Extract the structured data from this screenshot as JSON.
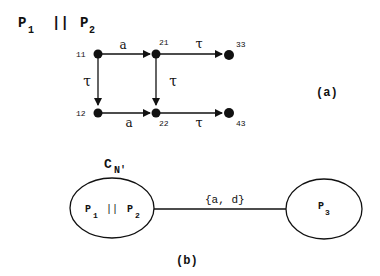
{
  "figure_a": {
    "title": {
      "p1": "P",
      "p1_sub": "1",
      "op": "||",
      "p2": "P",
      "p2_sub": "2"
    },
    "label": "(a)",
    "nodes": [
      {
        "id": "11",
        "label": "11"
      },
      {
        "id": "21",
        "label": "21"
      },
      {
        "id": "33",
        "label": "33"
      },
      {
        "id": "12",
        "label": "12"
      },
      {
        "id": "22",
        "label": "22"
      },
      {
        "id": "43",
        "label": "43"
      }
    ],
    "edges": [
      {
        "from": "11",
        "to": "21",
        "label": "a"
      },
      {
        "from": "21",
        "to": "33",
        "label": "τ"
      },
      {
        "from": "11",
        "to": "12",
        "label": "τ"
      },
      {
        "from": "21",
        "to": "22",
        "label": "τ"
      },
      {
        "from": "12",
        "to": "22",
        "label": "a"
      },
      {
        "from": "22",
        "to": "43",
        "label": "τ"
      }
    ]
  },
  "figure_b": {
    "label": "(b)",
    "network_label": {
      "main": "C",
      "sub": "N'"
    },
    "left_node": {
      "p1": "P",
      "p1_sub": "1",
      "op": "||",
      "p2": "P",
      "p2_sub": "2"
    },
    "right_node": {
      "p": "P",
      "p_sub": "3"
    },
    "link_label": "{a, d}"
  }
}
